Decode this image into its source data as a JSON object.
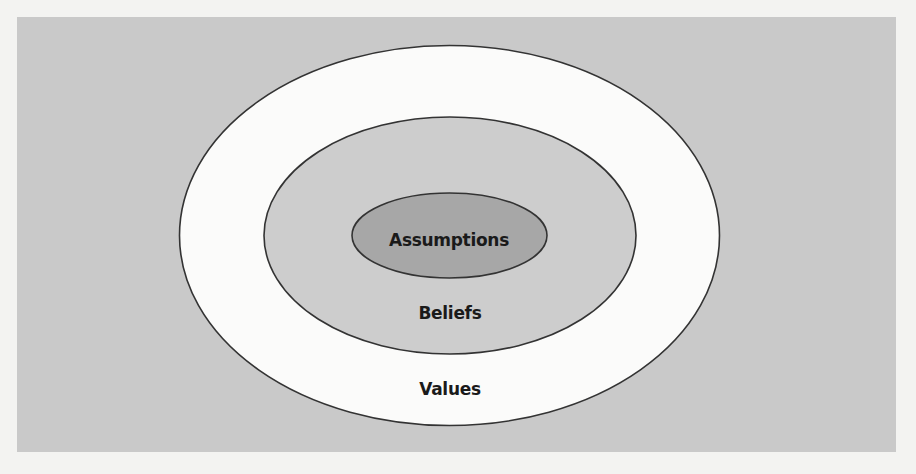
{
  "diagram": {
    "type": "concentric-ellipses",
    "layers": [
      {
        "id": "values",
        "label": "Values",
        "fill": "#fbfbfa",
        "stroke": "#333333"
      },
      {
        "id": "beliefs",
        "label": "Beliefs",
        "fill": "#cdcdcd",
        "stroke": "#333333"
      },
      {
        "id": "assumptions",
        "label": "Assumptions",
        "fill": "#a7a7a7",
        "stroke": "#333333"
      }
    ],
    "background_panel": "#c9c9c9"
  }
}
